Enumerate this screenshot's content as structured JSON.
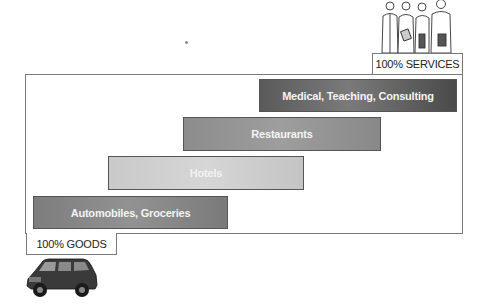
{
  "diagram": {
    "type": "goods-services-continuum",
    "top_right_label": "100% SERVICES",
    "bottom_left_label": "100% GOODS",
    "top_illustration": "professionals-group-icon",
    "bottom_illustration": "suv-car-icon",
    "bars": [
      {
        "label": "Medical, Teaching, Consulting",
        "shade": "#5e5e5e"
      },
      {
        "label": "Restaurants",
        "shade": "#939393"
      },
      {
        "label": "Hotels",
        "shade": "#cfcfcf"
      },
      {
        "label": "Automobiles, Groceries",
        "shade": "#868686"
      }
    ]
  }
}
